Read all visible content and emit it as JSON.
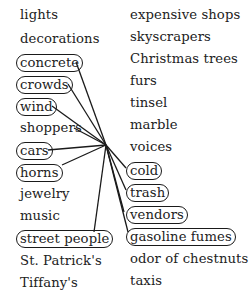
{
  "diagram": {
    "type": "word-web",
    "hub": {
      "x": 106,
      "y": 145
    },
    "line_color": "#1a1a1a",
    "text_color": "#222222",
    "left_column": {
      "x": 20,
      "items": [
        {
          "label": "lights",
          "circled": false,
          "y": 7
        },
        {
          "label": "decorations",
          "circled": false,
          "y": 31
        },
        {
          "label": "concrete",
          "circled": true,
          "y": 54
        },
        {
          "label": "crowds",
          "circled": true,
          "y": 76
        },
        {
          "label": "wind",
          "circled": true,
          "y": 98
        },
        {
          "label": "shoppers",
          "circled": false,
          "y": 120
        },
        {
          "label": "cars",
          "circled": true,
          "y": 142
        },
        {
          "label": "horns",
          "circled": true,
          "y": 164
        },
        {
          "label": "jewelry",
          "circled": false,
          "y": 186
        },
        {
          "label": "music",
          "circled": false,
          "y": 208
        },
        {
          "label": "street people",
          "circled": true,
          "y": 230
        },
        {
          "label": "St. Patrick's",
          "circled": false,
          "y": 253
        },
        {
          "label": "Tiffany's",
          "circled": false,
          "y": 275
        }
      ]
    },
    "right_column": {
      "x": 130,
      "items": [
        {
          "label": "expensive shops",
          "circled": false,
          "y": 7
        },
        {
          "label": "skyscrapers",
          "circled": false,
          "y": 29
        },
        {
          "label": "Christmas trees",
          "circled": false,
          "y": 51
        },
        {
          "label": "furs",
          "circled": false,
          "y": 73
        },
        {
          "label": "tinsel",
          "circled": false,
          "y": 95
        },
        {
          "label": "marble",
          "circled": false,
          "y": 117
        },
        {
          "label": "voices",
          "circled": false,
          "y": 139
        },
        {
          "label": "cold",
          "circled": true,
          "y": 162
        },
        {
          "label": "trash",
          "circled": true,
          "y": 184
        },
        {
          "label": "vendors",
          "circled": true,
          "y": 206
        },
        {
          "label": "gasoline fumes",
          "circled": true,
          "y": 228
        },
        {
          "label": "odor of chestnuts",
          "circled": false,
          "y": 251
        },
        {
          "label": "taxis",
          "circled": false,
          "y": 273
        }
      ]
    },
    "connections": [
      {
        "to": "concrete",
        "x": 76,
        "y": 62
      },
      {
        "to": "crowds",
        "x": 68,
        "y": 84
      },
      {
        "to": "wind",
        "x": 52,
        "y": 106
      },
      {
        "to": "shoppers",
        "x": 74,
        "y": 128
      },
      {
        "to": "cars",
        "x": 48,
        "y": 150
      },
      {
        "to": "horns",
        "x": 62,
        "y": 165
      },
      {
        "to": "street people",
        "x": 94,
        "y": 232
      },
      {
        "to": "cold",
        "x": 126,
        "y": 168
      },
      {
        "to": "trash",
        "x": 126,
        "y": 190
      },
      {
        "to": "vendors",
        "x": 124,
        "y": 212
      },
      {
        "to": "gasoline fumes",
        "x": 128,
        "y": 232
      }
    ]
  }
}
